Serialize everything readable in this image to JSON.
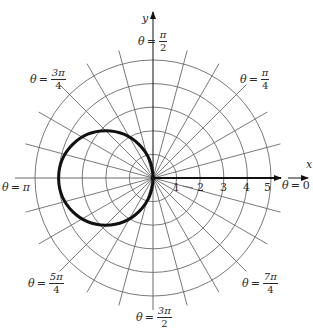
{
  "figure": {
    "axes": {
      "x_label": "x",
      "y_label": "y"
    },
    "radial_ticks": [
      "1",
      "2",
      "3",
      "4",
      "5"
    ],
    "angle_labels": {
      "theta0": {
        "prefix": "θ",
        "eq": "=",
        "value": "0"
      },
      "theta_pi4": {
        "prefix": "θ",
        "eq": "=",
        "num": "π",
        "den": "4"
      },
      "theta_pi2": {
        "prefix": "θ",
        "eq": "=",
        "num": "π",
        "den": "2"
      },
      "theta_3pi4": {
        "prefix": "θ",
        "eq": "=",
        "num": "3π",
        "den": "4"
      },
      "theta_pi": {
        "prefix": "θ",
        "eq": "=",
        "value": "π"
      },
      "theta_5pi4": {
        "prefix": "θ",
        "eq": "=",
        "num": "5π",
        "den": "4"
      },
      "theta_3pi2": {
        "prefix": "θ",
        "eq": "=",
        "num": "3π",
        "den": "2"
      },
      "theta_7pi4": {
        "prefix": "θ",
        "eq": "=",
        "num": "7π",
        "den": "4"
      }
    },
    "colors": {
      "grid": "#6a6a6a",
      "curve": "#111111",
      "text": "#2a2a2a",
      "background": "#ffffff"
    }
  },
  "chart_data": {
    "type": "polar",
    "title": "",
    "curve": {
      "description": "Circle through the pole, center at (r=2, θ=π), radius 2 (r = -4cosθ)",
      "center_cartesian": [
        -2,
        0
      ],
      "radius": 2
    },
    "polar_grid": {
      "rings": [
        1,
        2,
        3,
        4,
        5
      ],
      "radial_line_step_degrees": 15,
      "radial_line_count": 24
    },
    "axis_labels": {
      "x": "x",
      "y": "y"
    },
    "r_tick_labels": [
      "1",
      "2",
      "3",
      "4",
      "5"
    ],
    "angle_labels": [
      "θ = 0",
      "θ = π/4",
      "θ = π/2",
      "θ = 3π/4",
      "θ = π",
      "θ = 5π/4",
      "θ = 3π/2",
      "θ = 7π/4"
    ],
    "grid": true
  }
}
